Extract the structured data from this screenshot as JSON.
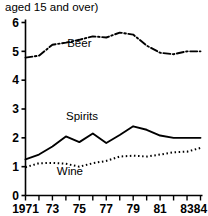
{
  "caption": "aged 15 and over)",
  "chart_data": {
    "type": "line",
    "title": "",
    "subtitle": "aged 15 and over)",
    "xlabel": "",
    "ylabel": "",
    "xlim": [
      1971,
      1984
    ],
    "ylim": [
      0,
      6
    ],
    "grid": false,
    "legend": "inline-labels",
    "x": [
      1971,
      1972,
      1973,
      1974,
      1975,
      1976,
      1977,
      1978,
      1979,
      1980,
      1981,
      1982,
      1983,
      1984
    ],
    "xtick_values": [
      1971,
      1972,
      1973,
      1974,
      1975,
      1976,
      1977,
      1978,
      1979,
      1980,
      1981,
      1982,
      1983,
      1984
    ],
    "xtick_labels": [
      "1971",
      "",
      "73",
      "",
      "75",
      "",
      "77",
      "",
      "79",
      "",
      "81",
      "",
      "83",
      "84"
    ],
    "ytick_values": [
      0,
      1,
      2,
      3,
      4,
      5,
      6
    ],
    "ytick_labels": [
      "0",
      "1",
      "2",
      "3",
      "4",
      "5",
      "6"
    ],
    "series": [
      {
        "name": "Beer",
        "linestyle": "dashdot",
        "color": "#000000",
        "label_x": 1975.0,
        "label_y": 5.15,
        "values": [
          4.78,
          4.85,
          5.23,
          5.3,
          5.4,
          5.52,
          5.48,
          5.65,
          5.58,
          5.2,
          4.95,
          4.9,
          5.0,
          5.0
        ]
      },
      {
        "name": "Spirits",
        "linestyle": "solid",
        "color": "#000000",
        "label_x": 1975.2,
        "label_y": 2.62,
        "values": [
          1.25,
          1.42,
          1.7,
          2.05,
          1.85,
          2.15,
          1.82,
          2.1,
          2.4,
          2.28,
          2.08,
          2.0,
          2.0,
          2.0
        ]
      },
      {
        "name": "Wine",
        "linestyle": "dotted",
        "color": "#000000",
        "label_x": 1974.3,
        "label_y": 0.72,
        "values": [
          0.98,
          1.12,
          1.13,
          1.1,
          1.0,
          1.12,
          1.2,
          1.35,
          1.38,
          1.35,
          1.42,
          1.5,
          1.52,
          1.65
        ]
      }
    ]
  }
}
